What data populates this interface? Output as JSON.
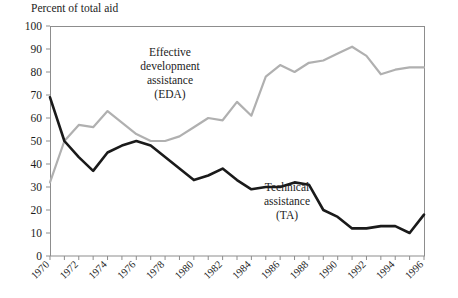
{
  "chart_data": {
    "type": "line",
    "title": "",
    "ylabel": "Percent of total aid",
    "xlabel": "",
    "ylim": [
      0,
      100
    ],
    "xlim": [
      1970,
      1996
    ],
    "ytick_step": 10,
    "yticks": [
      "0",
      "10",
      "20",
      "30",
      "40",
      "50",
      "60",
      "70",
      "80",
      "90",
      "100"
    ],
    "xticks": [
      "1970",
      "1972",
      "1974",
      "1976",
      "1978",
      "1980",
      "1982",
      "1984",
      "1986",
      "1988",
      "1990",
      "1992",
      "1994",
      "1996"
    ],
    "xtick_rotation_deg": 45,
    "x": [
      1970,
      1971,
      1972,
      1973,
      1974,
      1975,
      1976,
      1977,
      1978,
      1979,
      1980,
      1981,
      1982,
      1983,
      1984,
      1985,
      1986,
      1987,
      1988,
      1989,
      1990,
      1991,
      1992,
      1993,
      1994,
      1995,
      1996
    ],
    "grid": false,
    "legend_position": "inline-annotations",
    "series": [
      {
        "name": "Effective development assistance (EDA)",
        "short_name": "EDA",
        "color": "#b0b0b0",
        "width_px": 2.2,
        "values": [
          32,
          50,
          57,
          56,
          63,
          58,
          53,
          50,
          50,
          52,
          56,
          60,
          59,
          67,
          61,
          78,
          83,
          80,
          84,
          85,
          88,
          91,
          87,
          79,
          81,
          82,
          82
        ]
      },
      {
        "name": "Technical assistance (TA)",
        "short_name": "TA",
        "color": "#1a1a1a",
        "width_px": 2.6,
        "values": [
          69,
          50,
          43,
          37,
          45,
          48,
          50,
          48,
          43,
          38,
          33,
          35,
          38,
          33,
          29,
          30,
          30,
          32,
          31,
          20,
          17,
          12,
          12,
          13,
          13,
          10,
          18
        ]
      }
    ],
    "annotations": [
      {
        "id": "eda",
        "lines": [
          "Effective",
          "development",
          "assistance",
          "(EDA)"
        ],
        "x_px": 170,
        "y_px": 56
      },
      {
        "id": "ta",
        "lines": [
          "Technical",
          "assistance",
          "(TA)"
        ],
        "x_px": 287,
        "y_px": 191
      }
    ]
  },
  "plot_box": {
    "left_px": 50,
    "top_px": 26,
    "right_px": 424,
    "bottom_px": 256,
    "frame_color": "#8d8d8d"
  }
}
